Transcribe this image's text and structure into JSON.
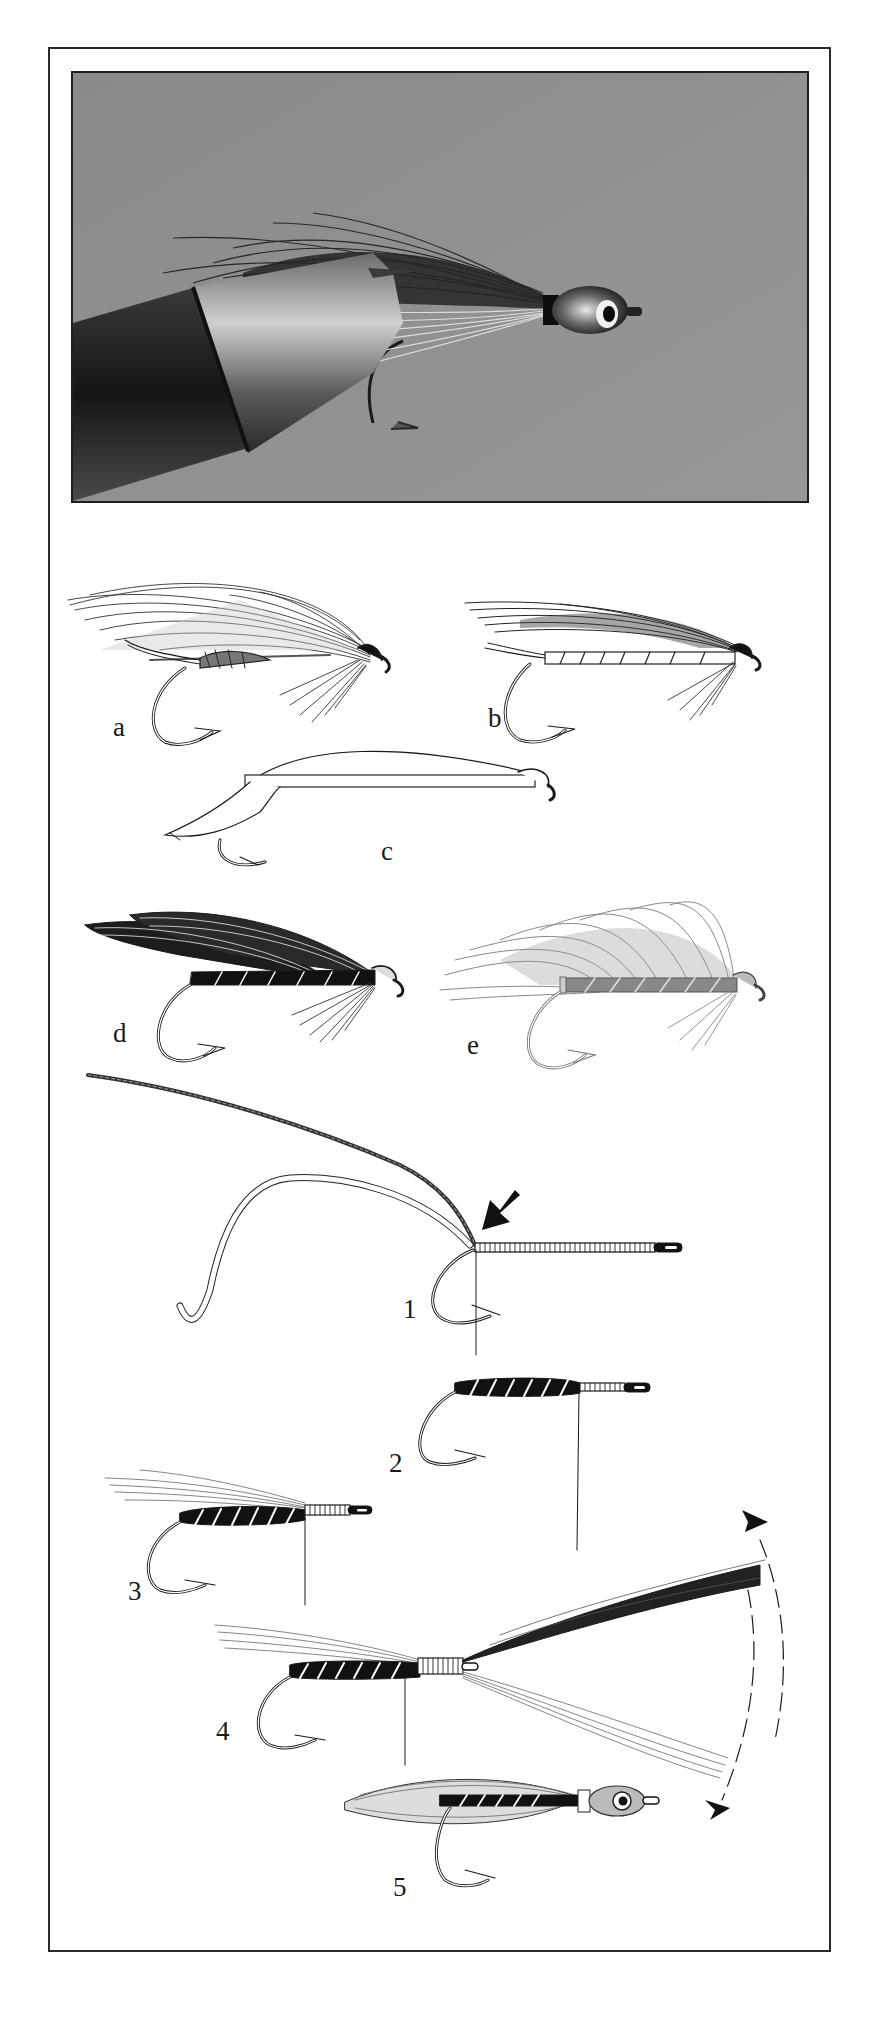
{
  "figure": {
    "photo": {
      "subject": "finished streamer fly with painted eye head clamped in vise jaws",
      "background_color": "#8f8f8f"
    },
    "fly_variants": [
      {
        "label": "a",
        "description": "feather-wing wet fly with ribbed body"
      },
      {
        "label": "b",
        "description": "slim wing fly with segmented ribbed body"
      },
      {
        "label": "c",
        "description": "outline fly with shellback-style wing"
      },
      {
        "label": "d",
        "description": "dark double-wing fly with black ribbed body"
      },
      {
        "label": "e",
        "description": "heavily hackled grey fly with ribbed body"
      }
    ],
    "steps": [
      {
        "label": "1",
        "description": "thread wrapped shank; tinsel and rib tied in at bend (arrow)"
      },
      {
        "label": "2",
        "description": "black body with white rib wrapped forward"
      },
      {
        "label": "3",
        "description": "light hair underwing tied in at head"
      },
      {
        "label": "4",
        "description": "hair bundle tied in, pulled back over and under (arc arrows)"
      },
      {
        "label": "5",
        "description": "finished fly with painted eye head"
      }
    ]
  }
}
